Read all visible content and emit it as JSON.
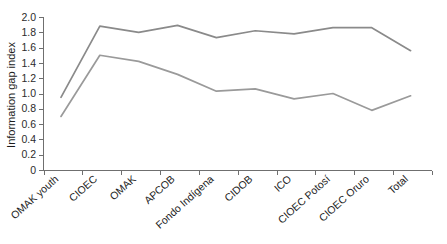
{
  "chart_data": {
    "type": "line",
    "title": "",
    "subtitle": "",
    "xlabel": "",
    "ylabel": "Information gap index",
    "ylim": [
      0,
      2.0
    ],
    "ytick_labels": [
      "0",
      "0.2",
      "0.4",
      "0.6",
      "0.8",
      "1.0",
      "1.2",
      "1.4",
      "1.6",
      "1.8",
      "2.0"
    ],
    "ytick_values": [
      0,
      0.2,
      0.4,
      0.6,
      0.8,
      1.0,
      1.2,
      1.4,
      1.6,
      1.8,
      2.0
    ],
    "grid": false,
    "legend": "none",
    "categories": [
      "OMAK youth",
      "CIOEC",
      "OMAK",
      "APCOB",
      "Fondo Indígena",
      "CIDOB",
      "ICO",
      "CIOEC Potosí",
      "CIOEC Oruro",
      "Total"
    ],
    "series": [
      {
        "name": "upper",
        "color": "#8a8a8a",
        "values": [
          0.95,
          1.88,
          1.8,
          1.89,
          1.73,
          1.82,
          1.78,
          1.86,
          1.86,
          1.56
        ]
      },
      {
        "name": "lower",
        "color": "#9a9a9a",
        "values": [
          0.7,
          1.5,
          1.42,
          1.25,
          1.03,
          1.06,
          0.93,
          1.0,
          0.78,
          0.97
        ]
      }
    ]
  },
  "colors": {
    "axis": "#6f6f6f",
    "text": "#1c1c1c",
    "background": "#ffffff"
  }
}
